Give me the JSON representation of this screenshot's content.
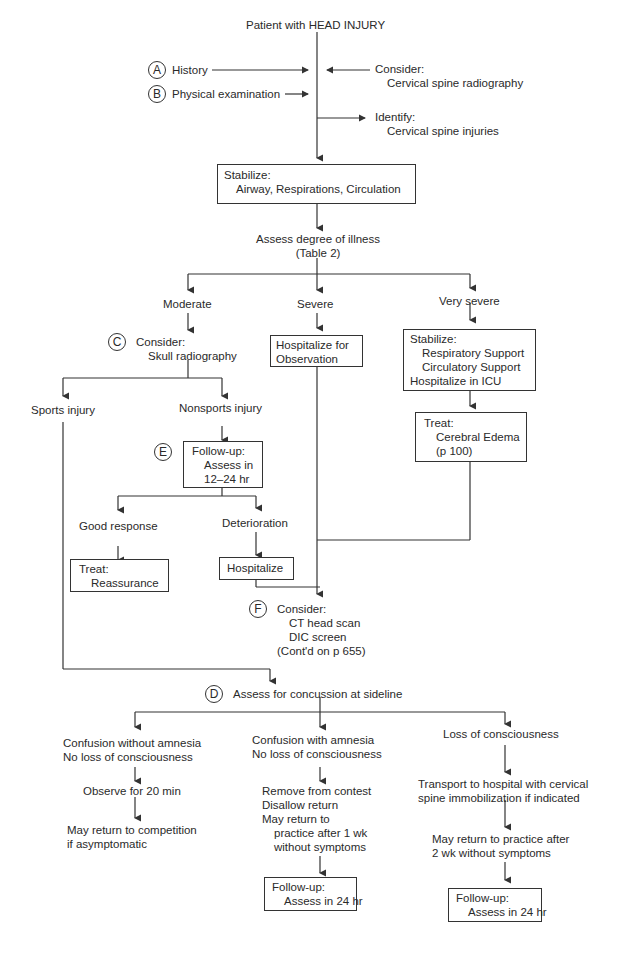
{
  "title": "Patient with HEAD INJURY",
  "top": {
    "history": {
      "marker": "A",
      "label": "History"
    },
    "physical": {
      "marker": "B",
      "label": "Physical examination"
    },
    "consider": {
      "label": "Consider:",
      "item": "Cervical spine radiography"
    },
    "identify": {
      "label": "Identify:",
      "item": "Cervical spine injuries"
    }
  },
  "stabilize": {
    "label": "Stabilize:",
    "item": "Airway, Respirations, Circulation"
  },
  "assess": {
    "line1": "Assess degree of illness",
    "line2": "(Table 2)"
  },
  "moderate": {
    "label": "Moderate",
    "consider": {
      "marker": "C",
      "label": "Consider:",
      "item": "Skull radiography"
    },
    "sports": "Sports injury",
    "nonsports": "Nonsports injury",
    "followup": {
      "marker": "E",
      "label": "Follow-up:",
      "line1": "Assess in",
      "line2": "12–24 hr"
    },
    "good": "Good response",
    "treat": {
      "label": "Treat:",
      "item": "Reassurance"
    },
    "deterioration": "Deterioration",
    "hospitalize": "Hospitalize"
  },
  "severe": {
    "label": "Severe",
    "box_line1": "Hospitalize for",
    "box_line2": "Observation"
  },
  "very_severe": {
    "label": "Very severe",
    "stabilize": {
      "label": "Stabilize:",
      "item1": "Respiratory Support",
      "item2": "Circulatory Support",
      "line3": "Hospitalize in ICU"
    },
    "treat": {
      "label": "Treat:",
      "item1": "Cerebral Edema",
      "item2": "(p 100)"
    }
  },
  "f_consider": {
    "marker": "F",
    "label": "Consider:",
    "item1": "CT head scan",
    "item2": "DIC screen",
    "item3": "(Cont'd on p 655)"
  },
  "d_assess": {
    "marker": "D",
    "label": "Assess for concussion at sideline"
  },
  "branches": {
    "left": {
      "line1": "Confusion without amnesia",
      "line2": "No loss of consciousness",
      "step1": "Observe for 20 min",
      "step2a": "May return to competition",
      "step2b": "if asymptomatic"
    },
    "middle": {
      "line1": "Confusion with amnesia",
      "line2": "No loss of consciousness",
      "step1a": "Remove from contest",
      "step1b": "Disallow return",
      "step1c": "May return to",
      "step1d": "practice after 1 wk",
      "step1e": "without symptoms",
      "follow_label": "Follow-up:",
      "follow_item": "Assess in 24 hr"
    },
    "right": {
      "line1": "Loss of consciousness",
      "step1a": "Transport to hospital with cervical",
      "step1b": "spine immobilization if indicated",
      "step2a": "May return to practice after",
      "step2b": "2 wk without symptoms",
      "follow_label": "Follow-up:",
      "follow_item": "Assess in 24 hr"
    }
  }
}
